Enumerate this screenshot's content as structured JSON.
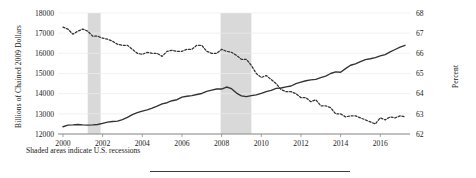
{
  "figure": {
    "caption": "Shaded areas indicate U.S. recessions",
    "left_axis_label": "Billions of Chained 2009 Dollars",
    "right_axis_label": "Percent"
  },
  "chart_data": {
    "type": "line",
    "title": "",
    "xlabel": "",
    "grid": false,
    "legend": "none",
    "xlim": [
      1999.75,
      2017.5
    ],
    "x_ticks": [
      2000,
      2002,
      2004,
      2006,
      2008,
      2010,
      2012,
      2014,
      2016
    ],
    "axes": [
      {
        "side": "left",
        "label": "Billions of Chained 2009 Dollars",
        "ylim": [
          12000,
          18000
        ],
        "ticks": [
          12000,
          13000,
          14000,
          15000,
          16000,
          17000,
          18000
        ]
      },
      {
        "side": "right",
        "label": "Percent",
        "ylim": [
          62,
          68
        ],
        "ticks": [
          62,
          63,
          64,
          65,
          66,
          67,
          68
        ]
      }
    ],
    "annotations": [
      {
        "type": "shaded-band",
        "label": "U.S. recession",
        "x_start": 2001.25,
        "x_end": 2001.9
      },
      {
        "type": "shaded-band",
        "label": "U.S. recession",
        "x_start": 2007.95,
        "x_end": 2009.5
      }
    ],
    "series": [
      {
        "name": "Real Gross Domestic Product",
        "axis": "left",
        "style": "solid",
        "color": "#333333",
        "x": [
          2000.0,
          2000.25,
          2000.5,
          2000.75,
          2001.0,
          2001.25,
          2001.5,
          2001.75,
          2002.0,
          2002.25,
          2002.5,
          2002.75,
          2003.0,
          2003.25,
          2003.5,
          2003.75,
          2004.0,
          2004.25,
          2004.5,
          2004.75,
          2005.0,
          2005.25,
          2005.5,
          2005.75,
          2006.0,
          2006.25,
          2006.5,
          2006.75,
          2007.0,
          2007.25,
          2007.5,
          2007.75,
          2008.0,
          2008.25,
          2008.5,
          2008.75,
          2009.0,
          2009.25,
          2009.5,
          2009.75,
          2010.0,
          2010.25,
          2010.5,
          2010.75,
          2011.0,
          2011.25,
          2011.5,
          2011.75,
          2012.0,
          2012.25,
          2012.5,
          2012.75,
          2013.0,
          2013.25,
          2013.5,
          2013.75,
          2014.0,
          2014.25,
          2014.5,
          2014.75,
          2015.0,
          2015.25,
          2015.5,
          2015.75,
          2016.0,
          2016.25,
          2016.5,
          2016.75,
          2017.0,
          2017.25
        ],
        "values": [
          12360,
          12440,
          12450,
          12470,
          12450,
          12440,
          12450,
          12470,
          12530,
          12590,
          12620,
          12640,
          12710,
          12820,
          12960,
          13060,
          13130,
          13200,
          13280,
          13380,
          13490,
          13550,
          13650,
          13700,
          13830,
          13870,
          13900,
          13960,
          14010,
          14110,
          14180,
          14230,
          14230,
          14330,
          14250,
          14030,
          13890,
          13850,
          13900,
          13940,
          14010,
          14100,
          14160,
          14260,
          14280,
          14340,
          14380,
          14500,
          14570,
          14640,
          14680,
          14710,
          14800,
          14870,
          15000,
          15080,
          15060,
          15240,
          15410,
          15480,
          15590,
          15690,
          15730,
          15790,
          15870,
          15940,
          16070,
          16190,
          16310,
          16400
        ]
      },
      {
        "name": "Labor Force Participation Rate",
        "axis": "right",
        "style": "dashed",
        "color": "#333333",
        "x": [
          2000.0,
          2000.25,
          2000.5,
          2000.75,
          2001.0,
          2001.25,
          2001.5,
          2001.75,
          2002.0,
          2002.25,
          2002.5,
          2002.75,
          2003.0,
          2003.25,
          2003.5,
          2003.75,
          2004.0,
          2004.25,
          2004.5,
          2004.75,
          2005.0,
          2005.25,
          2005.5,
          2005.75,
          2006.0,
          2006.25,
          2006.5,
          2006.75,
          2007.0,
          2007.25,
          2007.5,
          2007.75,
          2008.0,
          2008.25,
          2008.5,
          2008.75,
          2009.0,
          2009.25,
          2009.5,
          2009.75,
          2010.0,
          2010.25,
          2010.5,
          2010.75,
          2011.0,
          2011.25,
          2011.5,
          2011.75,
          2012.0,
          2012.25,
          2012.5,
          2012.75,
          2013.0,
          2013.25,
          2013.5,
          2013.75,
          2014.0,
          2014.25,
          2014.5,
          2014.75,
          2015.0,
          2015.25,
          2015.5,
          2015.75,
          2016.0,
          2016.25,
          2016.5,
          2016.75,
          2017.0,
          2017.25
        ],
        "values": [
          67.3,
          67.2,
          66.95,
          67.1,
          67.2,
          67.1,
          66.85,
          66.85,
          66.75,
          66.7,
          66.6,
          66.45,
          66.4,
          66.4,
          66.2,
          66.0,
          65.95,
          66.05,
          66.0,
          66.0,
          65.85,
          66.1,
          66.15,
          66.1,
          66.1,
          66.2,
          66.2,
          66.4,
          66.4,
          66.1,
          66.0,
          66.0,
          66.2,
          66.1,
          66.05,
          65.9,
          65.7,
          65.7,
          65.4,
          65.0,
          64.8,
          64.9,
          64.7,
          64.5,
          64.2,
          64.1,
          64.1,
          64.0,
          63.8,
          63.8,
          63.6,
          63.7,
          63.4,
          63.4,
          63.3,
          63.0,
          63.0,
          62.85,
          62.9,
          62.9,
          62.8,
          62.7,
          62.6,
          62.5,
          62.8,
          62.7,
          62.85,
          62.8,
          62.9,
          62.85
        ]
      }
    ]
  }
}
